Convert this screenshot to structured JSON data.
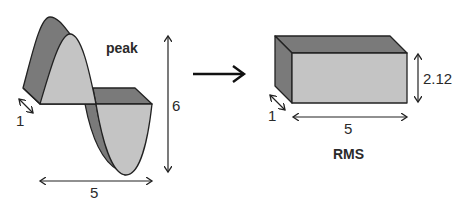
{
  "diagram": {
    "left": {
      "title": "peak",
      "depth_label": "1",
      "width_label": "5",
      "height_label": "6"
    },
    "arrow": "transform-arrow",
    "right": {
      "title": "RMS",
      "depth_label": "1",
      "width_label": "5",
      "height_label": "2.12"
    },
    "colors": {
      "dark_face": "#7a7a7a",
      "light_face": "#c4c4c4",
      "stroke": "#222222"
    }
  }
}
